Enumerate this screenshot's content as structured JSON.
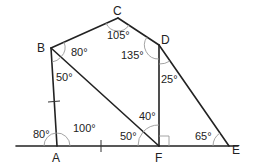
{
  "diagram": {
    "points": {
      "A": {
        "label": "A",
        "x": 57,
        "y": 146
      },
      "B": {
        "label": "B",
        "x": 51,
        "y": 48
      },
      "C": {
        "label": "C",
        "x": 118,
        "y": 18
      },
      "D": {
        "label": "D",
        "x": 159,
        "y": 45
      },
      "E": {
        "label": "E",
        "x": 229,
        "y": 146
      },
      "F": {
        "label": "F",
        "x": 159,
        "y": 146
      }
    },
    "angles": {
      "A_left": "80°",
      "A_right": "100°",
      "B_upper": "80°",
      "B_lower": "50°",
      "C": "105°",
      "D_left": "135°",
      "D_lower": "25°",
      "F_upper": "40°",
      "F_left": "50°",
      "E": "65°"
    },
    "right_angle_at": "F",
    "equal_marks": [
      "AB",
      "AF"
    ]
  }
}
